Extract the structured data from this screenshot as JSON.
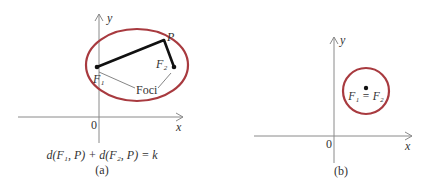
{
  "figure_a": {
    "caption": "(a)",
    "equation": "d(F₁, P) + d(F₂, P) = k",
    "axis_x_label": "x",
    "axis_y_label": "y",
    "origin_label": "0",
    "point_label": "P",
    "focus1_label": "F₁",
    "focus2_label": "F₂",
    "foci_label": "Foci",
    "ellipse_color": "#a83a3f"
  },
  "figure_b": {
    "caption": "(b)",
    "axis_x_label": "x",
    "axis_y_label": "y",
    "origin_label": "0",
    "foci_label": "F₁ = F₂",
    "circle_color": "#a83a3f"
  }
}
